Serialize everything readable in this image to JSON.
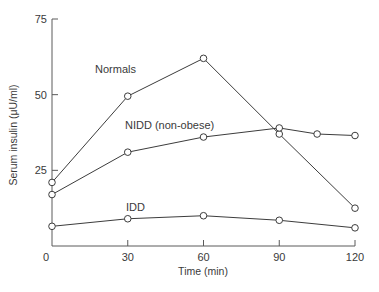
{
  "chart_data": {
    "type": "line",
    "title": "",
    "xlabel": "Time (min)",
    "ylabel": "Serum insulin (μU/ml)",
    "xlim": [
      0,
      120
    ],
    "ylim": [
      0,
      75
    ],
    "x_ticks": [
      0,
      30,
      60,
      90,
      120
    ],
    "y_ticks": [
      25,
      50,
      75
    ],
    "grid": false,
    "legend_position": "inline labels",
    "series": [
      {
        "name": "Normals",
        "x": [
          0,
          30,
          60,
          90,
          120
        ],
        "values": [
          21,
          49.5,
          62,
          37,
          12.5
        ],
        "label_pos": {
          "x": 95,
          "y": 73
        }
      },
      {
        "name": "NIDD (non-obese)",
        "x": [
          0,
          30,
          60,
          90,
          105,
          120
        ],
        "values": [
          17,
          31,
          36,
          39,
          37,
          36.5
        ],
        "label_pos": {
          "x": 125,
          "y": 129
        }
      },
      {
        "name": "IDD",
        "x": [
          0,
          30,
          60,
          90,
          120
        ],
        "values": [
          6.5,
          9,
          10,
          8.5,
          6
        ],
        "label_pos": {
          "x": 126,
          "y": 211
        }
      }
    ]
  }
}
